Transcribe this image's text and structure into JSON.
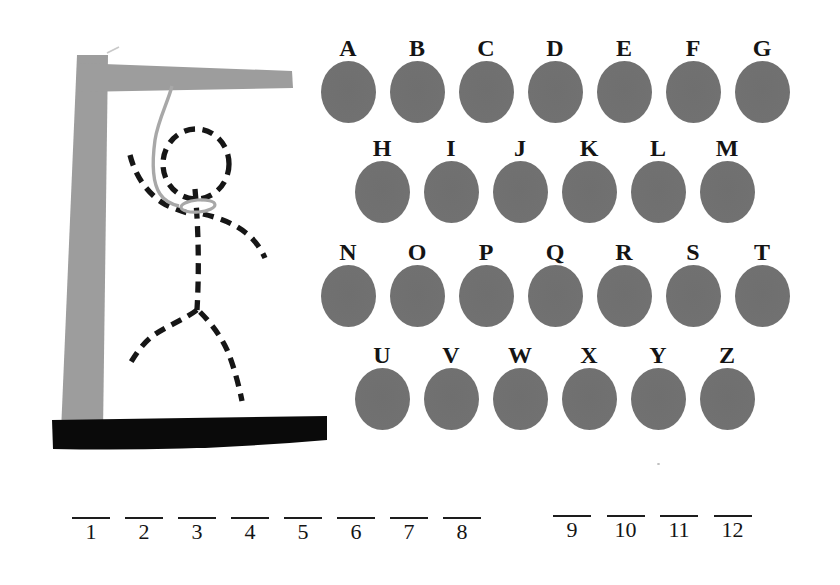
{
  "keyboard": {
    "rows": [
      {
        "letters": [
          "A",
          "B",
          "C",
          "D",
          "E",
          "F",
          "G"
        ]
      },
      {
        "letters": [
          "H",
          "I",
          "J",
          "K",
          "L",
          "M"
        ]
      },
      {
        "letters": [
          "N",
          "O",
          "P",
          "Q",
          "R",
          "S",
          "T"
        ]
      },
      {
        "letters": [
          "U",
          "V",
          "W",
          "X",
          "Y",
          "Z"
        ]
      }
    ]
  },
  "answer_slots": {
    "groups": [
      {
        "slots": [
          "1",
          "2",
          "3",
          "4",
          "5",
          "6",
          "7",
          "8"
        ]
      },
      {
        "slots": [
          "9",
          "10",
          "11",
          "12"
        ]
      }
    ]
  },
  "drawing": {
    "parts": [
      "gallows-post",
      "gallows-beam",
      "gallows-base",
      "rope",
      "noose-loop",
      "hangman-head",
      "hangman-left-arm",
      "hangman-right-arm",
      "hangman-body",
      "hangman-left-leg",
      "hangman-right-leg"
    ]
  },
  "colors": {
    "background": "#ffffff",
    "gallows_gray": "#9d9d9d",
    "rope_gray": "#a8a8a8",
    "letter_cover_gray": "#707070",
    "base_black": "#0a0a0a",
    "figure_black": "#161616",
    "text_black": "#141414"
  }
}
